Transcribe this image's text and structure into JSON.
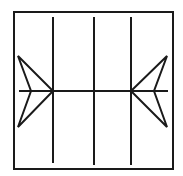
{
  "diagram": {
    "stroke_color": "#1a1a1a",
    "background": "#ffffff",
    "frame": {
      "x": 14,
      "y": 12,
      "w": 159,
      "h": 157
    },
    "vertical_lines": [
      {
        "x": 53,
        "y1": 17,
        "y2": 163
      },
      {
        "x": 94,
        "y1": 17,
        "y2": 165
      },
      {
        "x": 131,
        "y1": 17,
        "y2": 165
      }
    ],
    "horizontal_line": {
      "y": 91,
      "x1": 19,
      "x2": 168
    },
    "arrows": [
      {
        "side": "left",
        "points": "18,56 53,91 18,127 31,91"
      },
      {
        "side": "right",
        "points": "167,56 131,91 167,127 154,91"
      }
    ]
  }
}
